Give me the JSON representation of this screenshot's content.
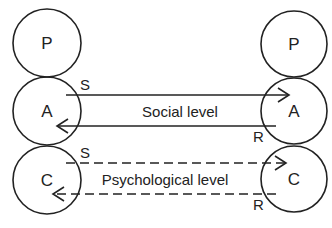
{
  "diagram": {
    "type": "transactional-analysis-ulterior-transaction",
    "left_person": {
      "states": [
        {
          "id": "P",
          "label": "P"
        },
        {
          "id": "A",
          "label": "A"
        },
        {
          "id": "C",
          "label": "C"
        }
      ]
    },
    "right_person": {
      "states": [
        {
          "id": "P",
          "label": "P"
        },
        {
          "id": "A",
          "label": "A"
        },
        {
          "id": "C",
          "label": "C"
        }
      ]
    },
    "levels": {
      "social": {
        "label": "Social level",
        "stimulus_label": "S",
        "response_label": "R",
        "line_style": "solid"
      },
      "psychological": {
        "label": "Psychological level",
        "stimulus_label": "S",
        "response_label": "R",
        "line_style": "dashed"
      }
    },
    "colors": {
      "stroke": "#222222",
      "background": "#ffffff"
    }
  }
}
